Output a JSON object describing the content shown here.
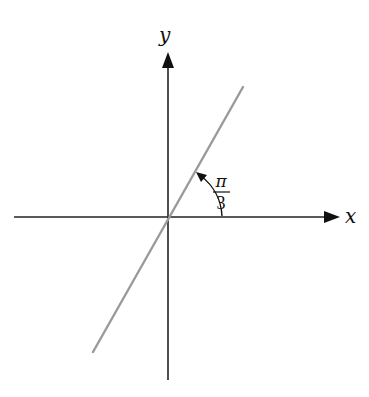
{
  "diagram": {
    "type": "coordinate-axes-with-line",
    "axes": {
      "x_label": "x",
      "y_label": "y"
    },
    "line": {
      "description": "line through origin",
      "color": "#9a9a9a"
    },
    "angle": {
      "numerator": "π",
      "denominator": "3",
      "meaning": "angle between positive x-axis and line"
    },
    "colors": {
      "axis": "#222222",
      "line": "#9a9a9a",
      "text": "#111111"
    }
  }
}
